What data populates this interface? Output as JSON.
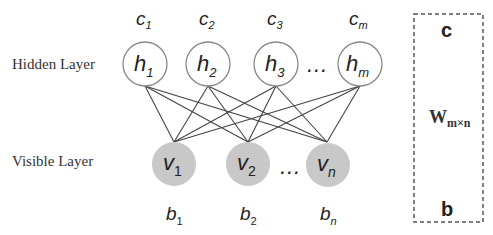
{
  "labels": {
    "hidden_layer": "Hidden Layer",
    "visible_layer": "Visible Layer"
  },
  "hidden_nodes": [
    {
      "name": "h",
      "sub": "1",
      "bias": "c",
      "bias_sub": "1"
    },
    {
      "name": "h",
      "sub": "2",
      "bias": "c",
      "bias_sub": "2"
    },
    {
      "name": "h",
      "sub": "3",
      "bias": "c",
      "bias_sub": "3"
    },
    {
      "name": "h",
      "sub": "m",
      "bias": "c",
      "bias_sub": "m"
    }
  ],
  "visible_nodes": [
    {
      "name": "v",
      "sub": "1",
      "bias": "b",
      "bias_sub": "1"
    },
    {
      "name": "v",
      "sub": "2",
      "bias": "b",
      "bias_sub": "2"
    },
    {
      "name": "v",
      "sub": "n",
      "bias": "b",
      "bias_sub": "n"
    }
  ],
  "ellipsis": "…",
  "param_box": {
    "top": "c",
    "middle": "W",
    "middle_sub": "m×n",
    "bottom": "b"
  },
  "colors": {
    "hidden_fill": "#ffffff",
    "hidden_stroke": "#888888",
    "visible_fill": "#c8c8c8",
    "edge": "#444444",
    "box_stroke": "#555555"
  }
}
